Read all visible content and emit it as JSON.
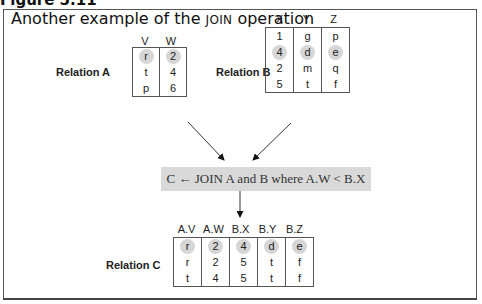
{
  "figure": {
    "label": "Figure 5.11",
    "title_prefix": "Another example of the ",
    "title_keyword": "JOIN",
    "title_suffix": " operation"
  },
  "relation_a": {
    "label": "Relation A",
    "columns": [
      "V",
      "W"
    ],
    "rows": [
      [
        "r",
        "2"
      ],
      [
        "t",
        "4"
      ],
      [
        "p",
        "6"
      ]
    ],
    "highlighted_row": 0
  },
  "relation_b": {
    "label": "Relation B",
    "columns": [
      "X",
      "Y",
      "Z"
    ],
    "rows": [
      [
        "1",
        "g",
        "p"
      ],
      [
        "4",
        "d",
        "e"
      ],
      [
        "2",
        "m",
        "q"
      ],
      [
        "5",
        "t",
        "f"
      ]
    ],
    "highlighted_row": 1
  },
  "operation": {
    "text": "C ← JOIN A and B where A.W < B.X"
  },
  "relation_c": {
    "label": "Relation C",
    "columns": [
      "A.V",
      "A.W",
      "B.X",
      "B.Y",
      "B.Z"
    ],
    "rows": [
      [
        "r",
        "2",
        "4",
        "d",
        "e"
      ],
      [
        "r",
        "2",
        "5",
        "t",
        "f"
      ],
      [
        "t",
        "4",
        "5",
        "t",
        "f"
      ]
    ],
    "highlighted_row": 0
  },
  "colors": {
    "highlight": "#d6d6d6",
    "operation_box": "#d9d9d9",
    "frame": "#555555"
  }
}
